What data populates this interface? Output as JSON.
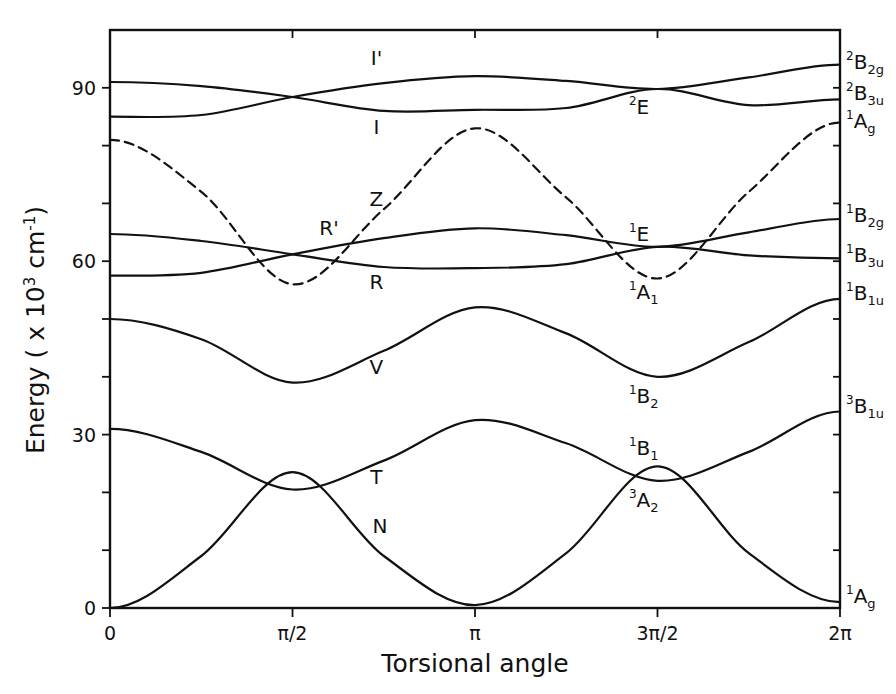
{
  "chart_data": {
    "type": "line",
    "title": "",
    "xlabel": "Torsional angle",
    "ylabel": "Energy ( x 10³ cm⁻¹)",
    "xlim": [
      0,
      6.2832
    ],
    "ylim": [
      0,
      100
    ],
    "grid": false,
    "legend": "none",
    "x_ticks": [
      {
        "value": 0,
        "label": "0"
      },
      {
        "value": 1.5708,
        "label": "π/2"
      },
      {
        "value": 3.1416,
        "label": "π"
      },
      {
        "value": 4.7124,
        "label": "3π/2"
      },
      {
        "value": 6.2832,
        "label": "2π"
      }
    ],
    "y_ticks": [
      {
        "value": 0,
        "label": "0"
      },
      {
        "value": 10,
        "label": ""
      },
      {
        "value": 20,
        "label": ""
      },
      {
        "value": 30,
        "label": "30"
      },
      {
        "value": 40,
        "label": ""
      },
      {
        "value": 50,
        "label": ""
      },
      {
        "value": 60,
        "label": "60"
      },
      {
        "value": 70,
        "label": ""
      },
      {
        "value": 80,
        "label": ""
      },
      {
        "value": 90,
        "label": "90"
      }
    ],
    "x_fraction_of_2pi": [
      0,
      0.125,
      0.25,
      0.375,
      0.5,
      0.625,
      0.75,
      0.875,
      1.0
    ],
    "series": [
      {
        "name": "N",
        "style": "solid",
        "values": [
          0.0,
          9.0,
          23.5,
          9.0,
          0.5,
          9.5,
          24.5,
          9.5,
          1.0
        ]
      },
      {
        "name": "T",
        "style": "solid",
        "values": [
          31.0,
          27.0,
          20.5,
          25.5,
          32.5,
          28.5,
          22.0,
          27.0,
          34.0
        ]
      },
      {
        "name": "V",
        "style": "solid",
        "values": [
          50.0,
          46.5,
          39.0,
          44.5,
          52.0,
          47.5,
          40.0,
          46.0,
          53.5
        ]
      },
      {
        "name": "R",
        "style": "solid",
        "values": [
          57.5,
          58.0,
          61.2,
          64.0,
          65.7,
          64.5,
          62.5,
          65.0,
          67.3
        ]
      },
      {
        "name": "R'",
        "style": "solid",
        "values": [
          64.7,
          63.5,
          61.2,
          59.0,
          58.8,
          59.5,
          62.5,
          61.0,
          60.5
        ]
      },
      {
        "name": "Z",
        "style": "dashed",
        "values": [
          81.0,
          72.0,
          56.0,
          69.0,
          83.0,
          71.0,
          57.0,
          72.0,
          84.0
        ]
      },
      {
        "name": "I",
        "style": "solid",
        "values": [
          85.0,
          85.3,
          88.4,
          90.8,
          92.0,
          91.2,
          89.8,
          91.8,
          94.0
        ]
      },
      {
        "name": "I'",
        "style": "solid",
        "values": [
          91.0,
          90.3,
          88.4,
          86.0,
          86.2,
          86.5,
          89.8,
          87.0,
          88.0
        ]
      }
    ],
    "curve_labels": [
      {
        "text": "I'",
        "x_frac": 0.365,
        "y": 94.0
      },
      {
        "text": "I",
        "x_frac": 0.365,
        "y": 82.0
      },
      {
        "text": "Z",
        "x_frac": 0.365,
        "y": 69.5
      },
      {
        "text": "R'",
        "x_frac": 0.3,
        "y": 64.5
      },
      {
        "text": "R",
        "x_frac": 0.365,
        "y": 55.2
      },
      {
        "text": "V",
        "x_frac": 0.365,
        "y": 40.5
      },
      {
        "text": "T",
        "x_frac": 0.365,
        "y": 21.5
      },
      {
        "text": "N",
        "x_frac": 0.37,
        "y": 13.0
      }
    ],
    "crossing_labels": [
      {
        "text": "E",
        "sup": "2",
        "sub": "",
        "x_frac": 0.73,
        "y": 85.5
      },
      {
        "text": "E",
        "sup": "1",
        "sub": "",
        "x_frac": 0.73,
        "y": 63.5
      },
      {
        "text": "A",
        "sup": "1",
        "sub": "1",
        "x_frac": 0.73,
        "y": 53.5
      },
      {
        "text": "B",
        "sup": "1",
        "sub": "2",
        "x_frac": 0.73,
        "y": 35.5
      },
      {
        "text": "B",
        "sup": "1",
        "sub": "1",
        "x_frac": 0.73,
        "y": 26.5
      },
      {
        "text": "A",
        "sup": "3",
        "sub": "2",
        "x_frac": 0.73,
        "y": 17.5
      }
    ],
    "right_state_labels": [
      {
        "text": "B",
        "sup": "2",
        "sub": "2g",
        "y": 94.0
      },
      {
        "text": "B",
        "sup": "2",
        "sub": "3u",
        "y": 88.5
      },
      {
        "text": "A",
        "sup": "1",
        "sub": "g",
        "y": 83.8
      },
      {
        "text": "B",
        "sup": "1",
        "sub": "2g",
        "y": 67.5
      },
      {
        "text": "B",
        "sup": "1",
        "sub": "3u",
        "y": 60.5
      },
      {
        "text": "B",
        "sup": "1",
        "sub": "1u",
        "y": 54.0
      },
      {
        "text": "B",
        "sup": "3",
        "sub": "1u",
        "y": 34.5
      },
      {
        "text": "A",
        "sup": "1",
        "sub": "g",
        "y": 1.5
      }
    ]
  },
  "colors": {
    "background": "#ffffff",
    "ink": "#111111"
  }
}
